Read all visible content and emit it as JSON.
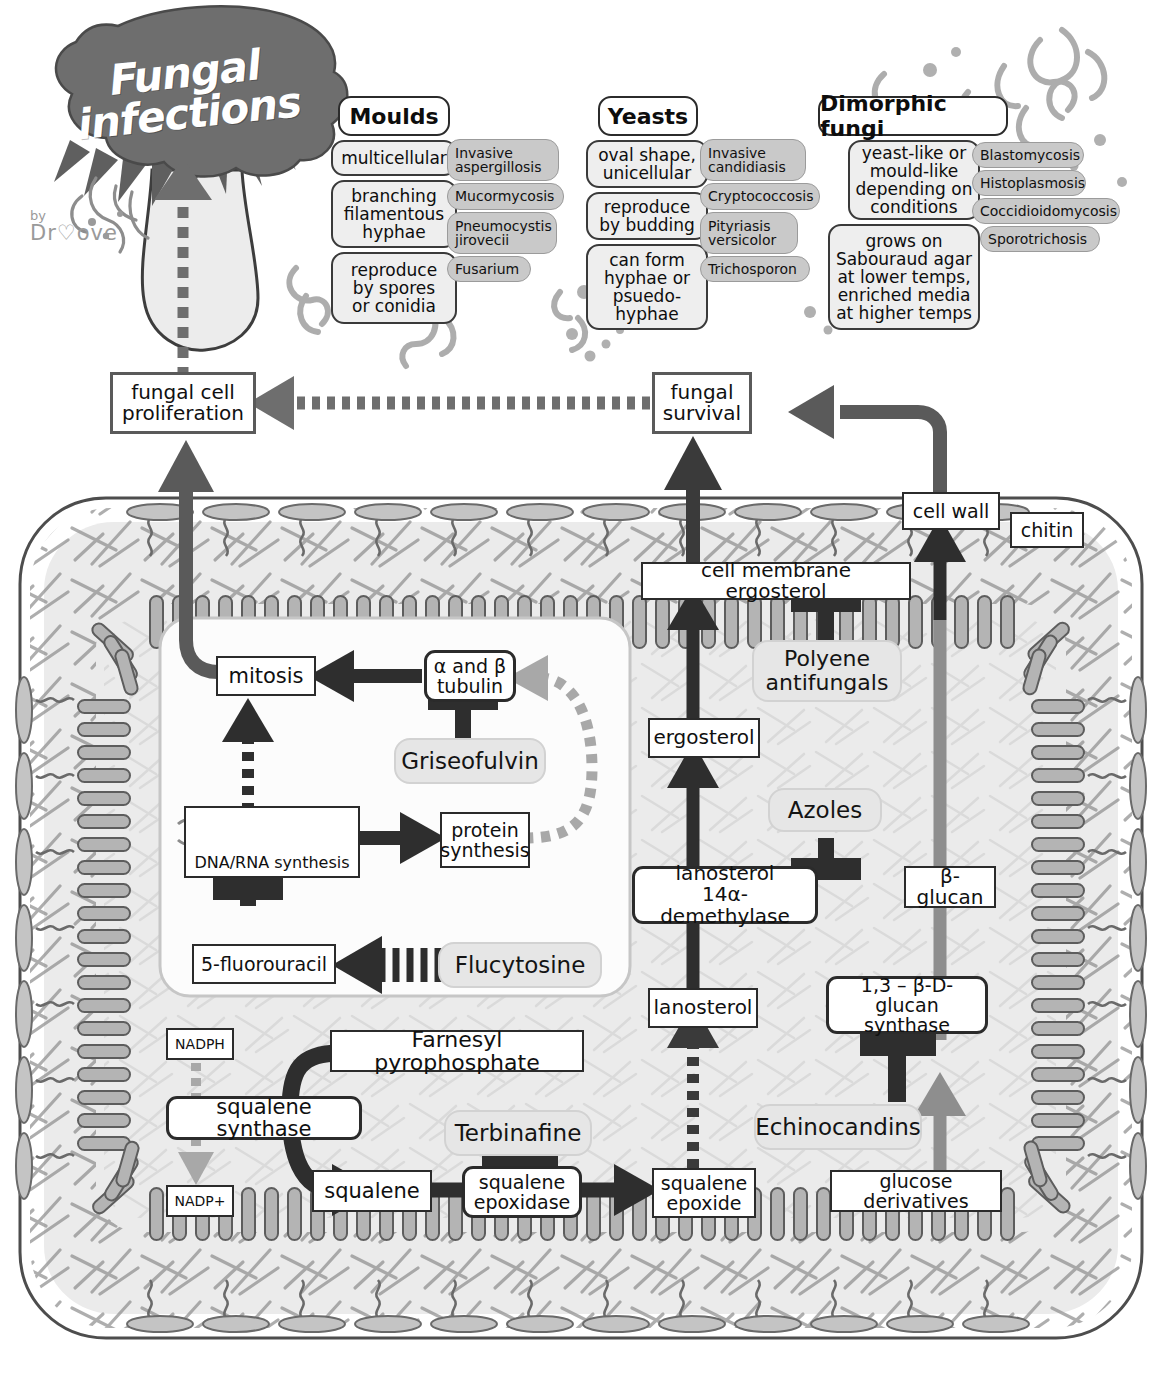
{
  "title": {
    "line1": "Fungal",
    "line2": "infections",
    "by_label": "by",
    "author": "Dr♡ove"
  },
  "categories": [
    {
      "name": "Moulds",
      "features": [
        "multicellular",
        "branching\nfilamentous\nhyphae",
        "reproduce\nby spores\nor conidia"
      ],
      "diseases": [
        "Invasive\naspergillosis",
        "Mucormycosis",
        "Pneumocystis\njirovecii",
        "Fusarium"
      ]
    },
    {
      "name": "Yeasts",
      "features": [
        "oval shape,\nunicellular",
        "reproduce\nby budding",
        "can form\nhyphae or\npsuedo-\nhyphae"
      ],
      "diseases": [
        "Invasive\ncandidiasis",
        "Cryptococcosis",
        "Pityriasis\nversicolor",
        "Trichosporon"
      ]
    },
    {
      "name": "Dimorphic fungi",
      "features": [
        "yeast-like or\nmould-like\ndepending on\nconditions",
        "grows on\nSabouraud agar\nat lower temps,\nenriched media\nat higher temps"
      ],
      "diseases": [
        "Blastomycosis",
        "Histoplasmosis",
        "Coccidioidomycosis",
        "Sporotrichosis"
      ]
    }
  ],
  "outcomes": {
    "proliferation": "fungal cell\nproliferation",
    "survival": "fungal\nsurvival"
  },
  "cell_labels": {
    "cell_wall": "cell wall",
    "chitin": "chitin",
    "membrane_ergosterol": "cell membrane ergosterol"
  },
  "nucleus": {
    "mitosis": "mitosis",
    "tubulin": "α and β\ntubulin",
    "griseofulvin": "Griseofulvin",
    "dna_rna": "DNA/RNA synthesis",
    "protein_synthesis": "protein\nsynthesis",
    "fluorouracil": "5-fluorouracil",
    "flucytosine": "Flucytosine"
  },
  "ergosterol_pathway": {
    "ergosterol": "ergosterol",
    "azoles": "Azoles",
    "demethylase": "lanosterol\n14α-demethylase",
    "lanosterol": "lanosterol",
    "polyene": "Polyene\nantifungals",
    "squalene_epoxide": "squalene\nepoxide"
  },
  "glucan_pathway": {
    "beta_glucan": "β-glucan",
    "glucan_synthase": "1,3 – β-D-glucan\nsynthase",
    "echinocandins": "Echinocandins",
    "glucose_derivatives": "glucose derivatives"
  },
  "squalene_pathway": {
    "nadph": "NADPH",
    "nadp": "NADP+",
    "farnesyl": "Farnesyl pyrophosphate",
    "squalene_synthase": "squalene synthase",
    "squalene": "squalene",
    "terbinafine": "Terbinafine",
    "squalene_epoxidase": "squalene\nepoxidase"
  },
  "colors": {
    "ink": "#2b2b2b",
    "arrow_dark": "#3a3a3a",
    "arrow_gray": "#9a9a9a",
    "drug_fill": "#e6e6e6",
    "blob": "#6e6e6e",
    "cytoplasm": "#ebebeb",
    "wall_rod": "#b4b4b4",
    "disease_fill": "#c9c9c9"
  }
}
